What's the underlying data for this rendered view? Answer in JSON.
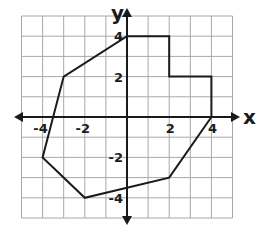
{
  "diagram": {
    "type": "coordinate-plane-polygon",
    "x_range": [
      -5,
      5
    ],
    "y_range": [
      -5,
      5
    ],
    "grid_step": 1,
    "axes": {
      "x_label": "x",
      "y_label": "y"
    },
    "x_tick_labels": [
      {
        "value": -4,
        "text": "-4"
      },
      {
        "value": -2,
        "text": "-2"
      },
      {
        "value": 2,
        "text": "2"
      },
      {
        "value": 4,
        "text": "4"
      }
    ],
    "y_tick_labels": [
      {
        "value": 4,
        "text": "4"
      },
      {
        "value": 2,
        "text": "2"
      },
      {
        "value": -2,
        "text": "-2"
      },
      {
        "value": -4,
        "text": "-4"
      }
    ],
    "polygon": {
      "vertices": [
        [
          0,
          4
        ],
        [
          2,
          4
        ],
        [
          2,
          2
        ],
        [
          4,
          2
        ],
        [
          4,
          0
        ],
        [
          2,
          -3
        ],
        [
          -2,
          -4
        ],
        [
          -4,
          -2
        ],
        [
          -3,
          2
        ]
      ],
      "stroke_color": "#1a1a1a"
    },
    "colors": {
      "grid": "#a8a8a8",
      "axis": "#1a1a1a",
      "background": "#ffffff"
    }
  }
}
